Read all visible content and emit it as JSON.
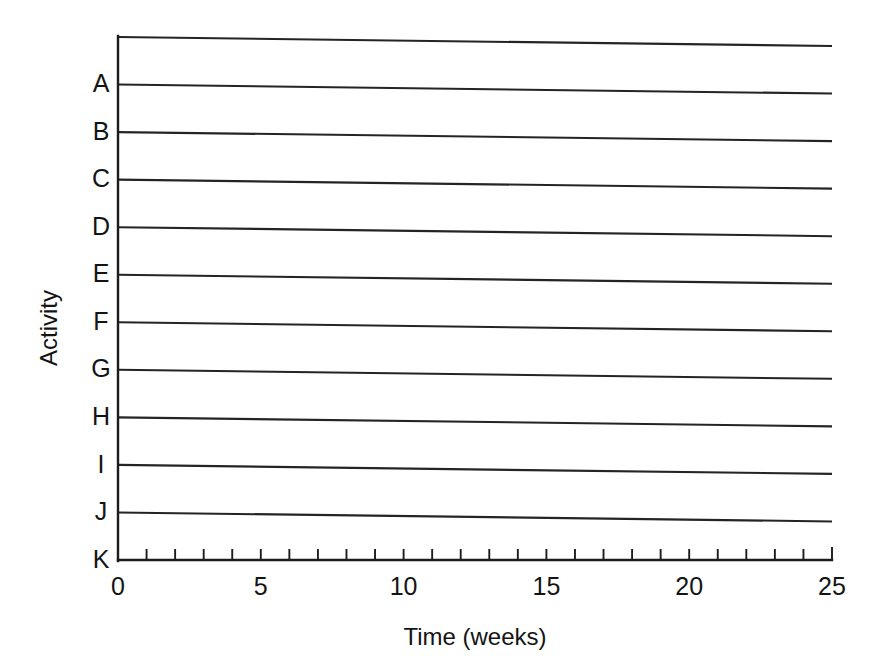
{
  "chart_data": {
    "type": "bar",
    "title": "",
    "subtitle": "",
    "xlabel": "Time (weeks)",
    "ylabel": "Activity",
    "orientation": "horizontal",
    "categories": [
      "A",
      "B",
      "C",
      "D",
      "E",
      "F",
      "G",
      "H",
      "I",
      "J",
      "K"
    ],
    "values": [
      null,
      null,
      null,
      null,
      null,
      null,
      null,
      null,
      null,
      null,
      null
    ],
    "series": [
      {
        "name": "Activity duration",
        "values": [
          null,
          null,
          null,
          null,
          null,
          null,
          null,
          null,
          null,
          null,
          null
        ]
      }
    ],
    "xlim": [
      0,
      25
    ],
    "x_tick_labels": [
      "0",
      "5",
      "10",
      "15",
      "20",
      "25"
    ],
    "x_tick_values": [
      0,
      5,
      10,
      15,
      20,
      25
    ],
    "x_minor_tick_interval": 1,
    "x_major_tick_interval": 5,
    "grid": "horizontal-rules-only",
    "legend": "none",
    "legend_position": "",
    "annotations": []
  },
  "axes": {
    "y_title": "Activity",
    "x_title": "Time (weeks)",
    "category_labels": [
      "A",
      "B",
      "C",
      "D",
      "E",
      "F",
      "G",
      "H",
      "I",
      "J",
      "K"
    ],
    "x_labels": [
      {
        "value": 0,
        "text": "0"
      },
      {
        "value": 5,
        "text": "5"
      },
      {
        "value": 10,
        "text": "10"
      },
      {
        "value": 15,
        "text": "15"
      },
      {
        "value": 20,
        "text": "20"
      },
      {
        "value": 25,
        "text": "25"
      }
    ]
  },
  "style": {
    "background_color": "#ffffff",
    "line_color": "#242424",
    "axis_color": "#1c1c1c",
    "text_color": "#141414"
  }
}
